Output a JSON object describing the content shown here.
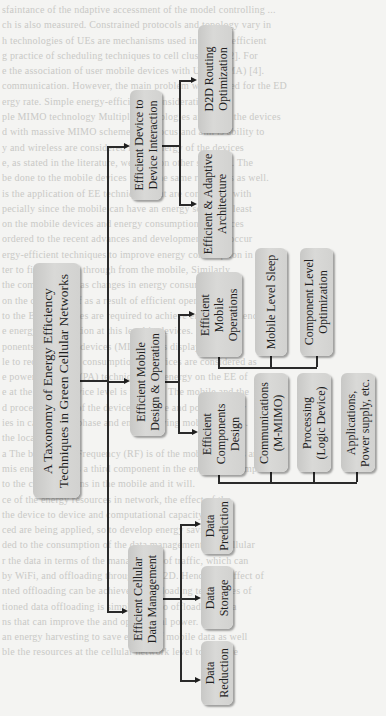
{
  "diagram": {
    "type": "taxonomy-tree",
    "orientation": "rotated-90-ccw",
    "root": {
      "label_line1": "A Taxonomy of Energy Efficiency",
      "label_line2": "Techniques in Green Cellular Networks"
    },
    "branches": [
      {
        "id": "d2d",
        "label_line1": "Efficient Device to",
        "label_line2": "Device Interaction",
        "children": [
          {
            "label_line1": "D2D Routing",
            "label_line2": "Optimization"
          },
          {
            "label_line1": "Efficient & Adaptive",
            "label_line2": "Architecture"
          }
        ]
      },
      {
        "id": "mobile",
        "label_line1": "Efficient Mobile",
        "label_line2": "Design & Operation",
        "children": [
          {
            "label_line1": "Efficient",
            "label_line2": "Mobile",
            "label_line3": "Operations",
            "children": [
              {
                "label_line1": "Mobile Level Sleep"
              },
              {
                "label_line1": "Component Level",
                "label_line2": "Optimization"
              }
            ]
          },
          {
            "label_line1": "Efficient",
            "label_line2": "Components",
            "label_line3": "Design",
            "children": [
              {
                "label_line1": "Communications",
                "label_line2": "(M-MIMO)"
              },
              {
                "label_line1": "Processing",
                "label_line2": "(Logic Device)"
              },
              {
                "label_line1": "Applications,",
                "label_line2": "Power supply, etc."
              }
            ]
          }
        ]
      },
      {
        "id": "data",
        "label_line1": "Efficient Cellular",
        "label_line2": "Data Management",
        "children": [
          {
            "label_line1": "Data",
            "label_line2": "Prediction"
          },
          {
            "label_line1": "Data",
            "label_line2": "Storage"
          },
          {
            "label_line1": "Data",
            "label_line2": "Reduction"
          }
        ]
      }
    ]
  },
  "colors": {
    "box_fill": "#d4d4d2",
    "line": "#2a2a2a",
    "background": "#f4f4f2",
    "bleed_text": "#c9c9c6"
  }
}
